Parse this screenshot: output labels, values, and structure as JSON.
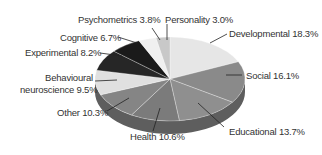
{
  "chart_data": {
    "type": "pie",
    "title": "",
    "style": "3d",
    "categories": [
      "Developmental",
      "Social",
      "Educational",
      "Health",
      "Other",
      "Behavioural neuroscience",
      "Experimental",
      "Cognitive",
      "Psychometrics",
      "Personality"
    ],
    "values": [
      18.3,
      16.1,
      13.7,
      10.6,
      10.3,
      9.5,
      8.2,
      6.7,
      3.8,
      3.0
    ],
    "unit": "%",
    "colors": [
      "#e6e6e6",
      "#8a8a8a",
      "#8f8f8f",
      "#7b7b7b",
      "#858585",
      "#e0e0e0",
      "#262626",
      "#1a1a1a",
      "#f0f0f0",
      "#c8c8c8"
    ],
    "labels": [
      {
        "text": "Developmental 18.3%"
      },
      {
        "text": "Social 16.1%"
      },
      {
        "text": "Educational 13.7%"
      },
      {
        "text": "Health 10.6%"
      },
      {
        "text": "Other 10.3%"
      },
      {
        "text": "Behavioural"
      },
      {
        "text": "neuroscience 9.5%"
      },
      {
        "text": "Experimental 8.2%"
      },
      {
        "text": "Cognitive 6.7%"
      },
      {
        "text": "Psychometrics 3.8%"
      },
      {
        "text": "Personality 3.0%"
      }
    ]
  }
}
